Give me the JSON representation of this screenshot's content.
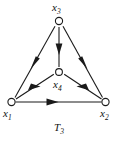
{
  "figure": {
    "caption_text": "T",
    "caption_subscript": "3",
    "stroke_color": "#1a1a1a",
    "node_fill_color": "#ffffff",
    "background_color": "#ffffff"
  },
  "diagram": {
    "type": "directed-graph",
    "nodes": [
      {
        "id": "x3",
        "text": "x",
        "sub": "3",
        "x": 59,
        "y": 21,
        "position": "top"
      },
      {
        "id": "x4",
        "text": "x",
        "sub": "4",
        "x": 59,
        "y": 72,
        "position": "center"
      },
      {
        "id": "x1",
        "text": "x",
        "sub": "1",
        "x": 11,
        "y": 102,
        "position": "bottom-left"
      },
      {
        "id": "x2",
        "text": "x",
        "sub": "2",
        "x": 106,
        "y": 102,
        "position": "bottom-right"
      }
    ],
    "edges": [
      {
        "id": "e-x3-x1",
        "from": "x3",
        "to": "x1",
        "label": "x3 to x1"
      },
      {
        "id": "e-x3-x2",
        "from": "x3",
        "to": "x2",
        "label": "x3 to x2"
      },
      {
        "id": "e-x3-x4",
        "from": "x3",
        "to": "x4",
        "label": "x3 to x4"
      },
      {
        "id": "e-x4-x1",
        "from": "x4",
        "to": "x1",
        "label": "x4 to x1"
      },
      {
        "id": "e-x4-x2",
        "from": "x4",
        "to": "x2",
        "label": "x4 to x2"
      },
      {
        "id": "e-x1-x2",
        "from": "x1",
        "to": "x2",
        "label": "x1 to x2"
      }
    ]
  }
}
